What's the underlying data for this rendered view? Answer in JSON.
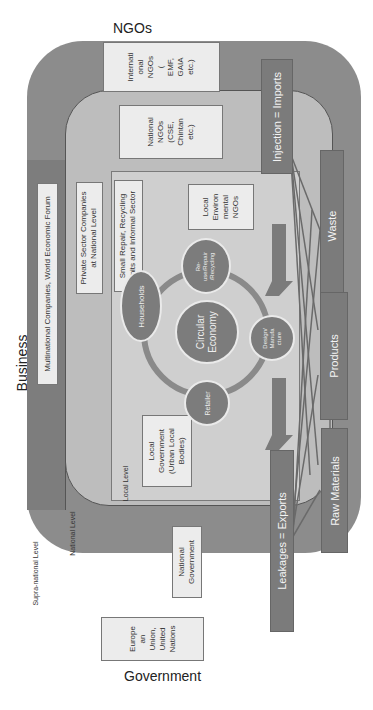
{
  "outer_labels": {
    "top": "NGOs",
    "left": "Business",
    "bottom": "Government"
  },
  "levels": {
    "supra_national": "Supra-national Level",
    "national": "National Level",
    "local": "Local Level"
  },
  "boxes": {
    "international_ngos": [
      "Internati",
      "onal",
      "NGOs",
      "(",
      "EMF,",
      "GAIA",
      "etc.)"
    ],
    "national_ngos": [
      "National",
      "NGOs",
      "(CSE,",
      "Chintan",
      "etc.)"
    ],
    "local_ngos": [
      "Local",
      "Environ",
      "mental",
      "NGOs"
    ],
    "multinational": "Multinational Companies, World Economic Forum",
    "private_sector": [
      "Private Sector Companies",
      "at National Level"
    ],
    "small_repair": [
      "Small Repair, Recycling",
      "Units and Informal Sector"
    ],
    "local_government": [
      "Local",
      "Government",
      "(Urban Local",
      "Bodies)"
    ],
    "national_government": [
      "National",
      "Government"
    ],
    "eu_un": [
      "Europe",
      "an",
      "Union,",
      "United",
      "Nations"
    ]
  },
  "circular_economy": {
    "center": [
      "Circular",
      "Economy"
    ],
    "nodes": {
      "households": "Households",
      "reuse": [
        "Re-",
        "use/Repair",
        "/Recycling"
      ],
      "design": [
        "Design/",
        "Manufa",
        "cture"
      ],
      "retailer": "Retailer"
    }
  },
  "flows": {
    "injection": "Injection = Imports",
    "leakage": "Leakages = Exports",
    "waste": "Waste",
    "products": "Products",
    "raw_materials": "Raw Materials"
  },
  "colors": {
    "supra": "#8c8c8c",
    "national": "#bdbdbd",
    "local": "#cfcfcf",
    "bar": "#7b7b7b",
    "box": "#ececec"
  }
}
